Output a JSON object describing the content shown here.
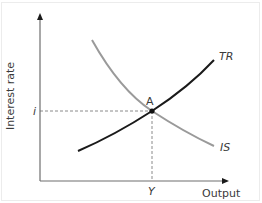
{
  "diagram": {
    "type": "IS-TR equilibrium diagram",
    "axes": {
      "x_label": "Output",
      "y_label": "Interest rate"
    },
    "curves": [
      {
        "name": "TR",
        "label": "TR",
        "color": "#1a1a1a",
        "slope": "upward"
      },
      {
        "name": "IS",
        "label": "IS",
        "color": "#9a9a9a",
        "slope": "downward"
      }
    ],
    "equilibrium": {
      "point_label": "A",
      "interest_rate_label": "i",
      "output_label": "Y"
    },
    "colors": {
      "axis": "#6e6e6e",
      "guide_dashed": "#8a8a8a",
      "text": "#3a3a3a",
      "frame": "#ececec"
    }
  }
}
